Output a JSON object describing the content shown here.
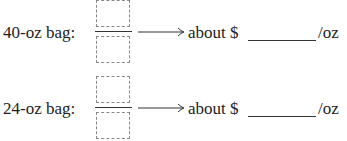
{
  "rows": [
    {
      "label": "40-oz bag:",
      "prefix": "about $",
      "answer_value": "",
      "unit": "/oz"
    },
    {
      "label": "24-oz bag:",
      "prefix": "about $",
      "answer_value": "",
      "unit": "/oz"
    }
  ]
}
